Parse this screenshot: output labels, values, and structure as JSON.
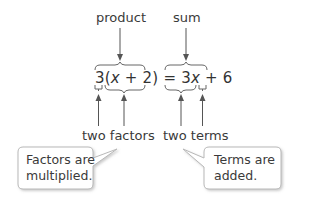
{
  "labels": {
    "product": "product",
    "sum": "sum",
    "two_factors": "two factors",
    "two_terms": "two terms"
  },
  "equation": {
    "left_coef": "3",
    "left_open": "(",
    "left_var": "x",
    "left_plus": " + ",
    "left_const": "2",
    "left_close": ")",
    "equals": " = ",
    "right_coef": "3",
    "right_var": "x",
    "right_plus": " + ",
    "right_const": "6"
  },
  "callouts": {
    "left": {
      "line1": "Factors are",
      "line2": "multiplied."
    },
    "right": {
      "line1": "Terms are",
      "line2": "added."
    }
  },
  "colors": {
    "text": "#333333",
    "arrow": "#555555",
    "brace": "#666666",
    "callout_border": "#b8b8b8",
    "callout_shadow": "#d6d6d6"
  }
}
